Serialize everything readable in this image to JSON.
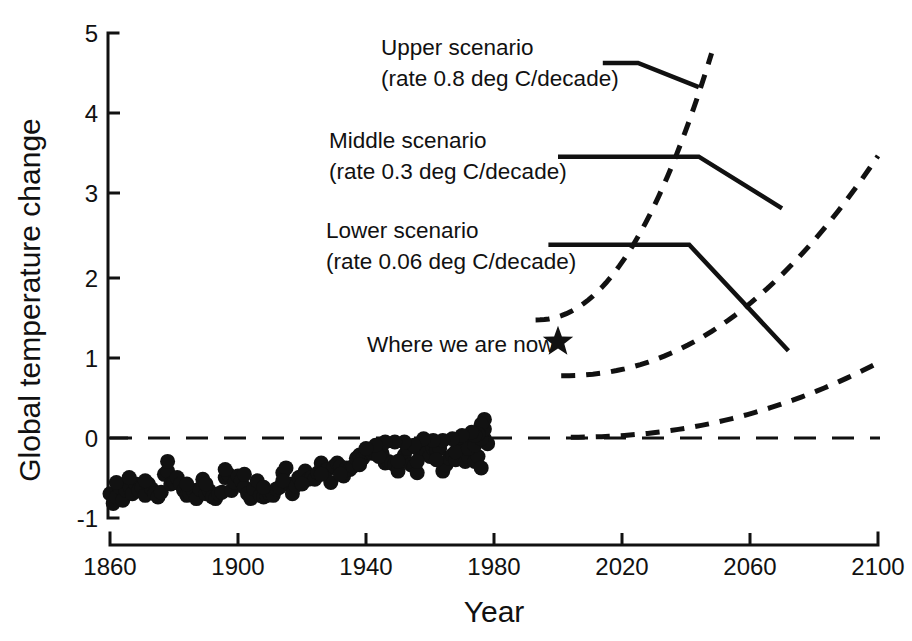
{
  "chart_data": {
    "type": "scatter",
    "title": "",
    "xlabel": "Year",
    "ylabel": "Global temperature change",
    "xlim": [
      1860,
      2100
    ],
    "ylim": [
      -1,
      5
    ],
    "xticks": [
      "1860",
      "1900",
      "1940",
      "1980",
      "2020",
      "2060",
      "2100"
    ],
    "xtick_values": [
      1860,
      1900,
      1940,
      1980,
      2020,
      2060,
      2100
    ],
    "yticks": [
      "-1",
      "0",
      "1",
      "2",
      "3",
      "4",
      "5"
    ],
    "ytick_values": [
      -1,
      0,
      1,
      2,
      3,
      4,
      5
    ],
    "grid": false,
    "legend": "none",
    "zero_reference_line": 0,
    "series": [
      {
        "name": "Observed global temperature change",
        "type": "scatter",
        "marker": "filled-circle",
        "x_range": [
          1860,
          1977
        ],
        "y_range": [
          -0.85,
          0.27
        ],
        "points": [
          [
            1860,
            -0.7
          ],
          [
            1861,
            -0.82
          ],
          [
            1862,
            -0.74
          ],
          [
            1863,
            -0.62
          ],
          [
            1864,
            -0.78
          ],
          [
            1865,
            -0.66
          ],
          [
            1866,
            -0.6
          ],
          [
            1867,
            -0.7
          ],
          [
            1868,
            -0.58
          ],
          [
            1869,
            -0.66
          ],
          [
            1870,
            -0.62
          ],
          [
            1871,
            -0.72
          ],
          [
            1872,
            -0.58
          ],
          [
            1873,
            -0.64
          ],
          [
            1874,
            -0.7
          ],
          [
            1875,
            -0.74
          ],
          [
            1876,
            -0.68
          ],
          [
            1877,
            -0.46
          ],
          [
            1878,
            -0.42
          ],
          [
            1879,
            -0.58
          ],
          [
            1880,
            -0.56
          ],
          [
            1881,
            -0.5
          ],
          [
            1882,
            -0.58
          ],
          [
            1883,
            -0.66
          ],
          [
            1884,
            -0.72
          ],
          [
            1885,
            -0.7
          ],
          [
            1886,
            -0.66
          ],
          [
            1887,
            -0.76
          ],
          [
            1888,
            -0.64
          ],
          [
            1889,
            -0.52
          ],
          [
            1890,
            -0.7
          ],
          [
            1891,
            -0.66
          ],
          [
            1892,
            -0.74
          ],
          [
            1893,
            -0.76
          ],
          [
            1894,
            -0.7
          ],
          [
            1895,
            -0.68
          ],
          [
            1896,
            -0.5
          ],
          [
            1897,
            -0.46
          ],
          [
            1898,
            -0.66
          ],
          [
            1899,
            -0.56
          ],
          [
            1900,
            -0.48
          ],
          [
            1901,
            -0.54
          ],
          [
            1902,
            -0.62
          ],
          [
            1903,
            -0.7
          ],
          [
            1904,
            -0.76
          ],
          [
            1905,
            -0.64
          ],
          [
            1906,
            -0.54
          ],
          [
            1907,
            -0.72
          ],
          [
            1908,
            -0.74
          ],
          [
            1909,
            -0.72
          ],
          [
            1910,
            -0.7
          ],
          [
            1911,
            -0.72
          ],
          [
            1912,
            -0.64
          ],
          [
            1913,
            -0.62
          ],
          [
            1914,
            -0.44
          ],
          [
            1915,
            -0.38
          ],
          [
            1916,
            -0.58
          ],
          [
            1917,
            -0.7
          ],
          [
            1918,
            -0.6
          ],
          [
            1919,
            -0.5
          ],
          [
            1920,
            -0.48
          ],
          [
            1921,
            -0.42
          ],
          [
            1922,
            -0.52
          ],
          [
            1923,
            -0.5
          ],
          [
            1924,
            -0.52
          ],
          [
            1925,
            -0.44
          ],
          [
            1926,
            -0.32
          ],
          [
            1927,
            -0.42
          ],
          [
            1928,
            -0.4
          ],
          [
            1929,
            -0.56
          ],
          [
            1930,
            -0.36
          ],
          [
            1931,
            -0.32
          ],
          [
            1932,
            -0.36
          ],
          [
            1933,
            -0.48
          ],
          [
            1934,
            -0.38
          ],
          [
            1935,
            -0.4
          ],
          [
            1936,
            -0.36
          ],
          [
            1937,
            -0.26
          ],
          [
            1938,
            -0.22
          ],
          [
            1939,
            -0.26
          ],
          [
            1940,
            -0.18
          ],
          [
            1941,
            -0.16
          ],
          [
            1942,
            -0.2
          ],
          [
            1943,
            -0.2
          ],
          [
            1944,
            -0.1
          ],
          [
            1945,
            -0.2
          ],
          [
            1946,
            -0.32
          ],
          [
            1947,
            -0.3
          ],
          [
            1948,
            -0.32
          ],
          [
            1949,
            -0.34
          ],
          [
            1950,
            -0.42
          ],
          [
            1951,
            -0.28
          ],
          [
            1952,
            -0.22
          ],
          [
            1953,
            -0.14
          ],
          [
            1954,
            -0.34
          ],
          [
            1955,
            -0.36
          ],
          [
            1956,
            -0.44
          ],
          [
            1957,
            -0.2
          ],
          [
            1958,
            -0.16
          ],
          [
            1959,
            -0.2
          ],
          [
            1960,
            -0.24
          ],
          [
            1961,
            -0.14
          ],
          [
            1962,
            -0.16
          ],
          [
            1963,
            -0.14
          ],
          [
            1964,
            -0.42
          ],
          [
            1965,
            -0.34
          ],
          [
            1966,
            -0.26
          ],
          [
            1967,
            -0.22
          ],
          [
            1968,
            -0.28
          ],
          [
            1969,
            -0.12
          ],
          [
            1970,
            -0.18
          ],
          [
            1971,
            -0.3
          ],
          [
            1972,
            -0.24
          ],
          [
            1973,
            -0.06
          ],
          [
            1974,
            -0.3
          ],
          [
            1975,
            -0.24
          ],
          [
            1976,
            -0.38
          ],
          [
            1977,
            -0.02
          ],
          [
            1978,
            -0.08
          ],
          [
            1862,
            -0.56
          ],
          [
            1866,
            -0.5
          ],
          [
            1871,
            -0.54
          ],
          [
            1878,
            -0.3
          ],
          [
            1884,
            -0.58
          ],
          [
            1890,
            -0.58
          ],
          [
            1896,
            -0.4
          ],
          [
            1902,
            -0.46
          ],
          [
            1908,
            -0.62
          ],
          [
            1914,
            -0.54
          ],
          [
            1920,
            -0.58
          ],
          [
            1926,
            -0.46
          ],
          [
            1932,
            -0.46
          ],
          [
            1938,
            -0.34
          ],
          [
            1944,
            -0.24
          ],
          [
            1950,
            -0.3
          ],
          [
            1956,
            -0.3
          ],
          [
            1962,
            -0.28
          ],
          [
            1968,
            -0.18
          ],
          [
            1972,
            -0.14
          ],
          [
            1974,
            -0.1
          ],
          [
            1976,
            -0.02
          ],
          [
            1977,
            0.1
          ],
          [
            1977,
            0.22
          ],
          [
            1976,
            0.16
          ],
          [
            1975,
            0.04
          ],
          [
            1974,
            0.02
          ],
          [
            1973,
            0.06
          ],
          [
            1970,
            0.02
          ],
          [
            1967,
            -0.02
          ],
          [
            1964,
            -0.04
          ],
          [
            1961,
            -0.04
          ],
          [
            1958,
            -0.02
          ],
          [
            1955,
            -0.1
          ],
          [
            1952,
            -0.06
          ],
          [
            1949,
            -0.06
          ],
          [
            1946,
            -0.06
          ],
          [
            1943,
            -0.1
          ],
          [
            1940,
            -0.14
          ]
        ]
      },
      {
        "name": "Upper scenario projection",
        "type": "dashed-curve",
        "rate_deg_c_per_decade": 0.8,
        "x_start": 1993,
        "x_end": 2048,
        "y_start": 1.45,
        "y_end": 4.75
      },
      {
        "name": "Middle scenario projection",
        "type": "dashed-curve",
        "rate_deg_c_per_decade": 0.3,
        "x_start": 2001,
        "x_end": 2100,
        "y_start": 0.76,
        "y_end": 3.48
      },
      {
        "name": "Lower scenario projection",
        "type": "dashed-curve",
        "rate_deg_c_per_decade": 0.06,
        "x_start": 2004,
        "x_end": 2100,
        "y_start": 0.0,
        "y_end": 0.92
      }
    ],
    "annotations": [
      {
        "name": "upper-scenario-label",
        "line1": "Upper scenario",
        "line2": "(rate 0.8 deg C/decade)",
        "leader_points": [
          [
            2014,
            4.63
          ],
          [
            2025,
            4.63
          ],
          [
            2044,
            4.33
          ]
        ]
      },
      {
        "name": "middle-scenario-label",
        "line1": "Middle scenario",
        "line2": "(rate 0.3 deg C/decade)",
        "leader_points": [
          [
            2000,
            3.47
          ],
          [
            2044,
            3.47
          ],
          [
            2070,
            2.83
          ]
        ]
      },
      {
        "name": "lower-scenario-label",
        "line1": "Lower scenario",
        "line2": "(rate 0.06 deg C/decade)",
        "leader_points": [
          [
            1997,
            2.38
          ],
          [
            2041,
            2.38
          ],
          [
            2072,
            1.07
          ]
        ]
      },
      {
        "name": "where-we-are-now-label",
        "line1": "Where we are now",
        "marker": "star",
        "marker_point": [
          2000,
          1.18
        ]
      }
    ]
  },
  "axes": {
    "y_title": "Global temperature change",
    "x_title": "Year",
    "y_tick_labels": [
      "5",
      "4",
      "3",
      "2",
      "1",
      "0",
      "-1"
    ],
    "x_tick_labels": [
      "1860",
      "1900",
      "1940",
      "1980",
      "2020",
      "2060",
      "2100"
    ]
  },
  "labels": {
    "upper_line1": "Upper scenario",
    "upper_line2": "(rate 0.8 deg C/decade)",
    "middle_line1": "Middle scenario",
    "middle_line2": "(rate 0.3 deg C/decade)",
    "lower_line1": "Lower scenario",
    "lower_line2": "(rate 0.06 deg C/decade)",
    "now_label": "Where we are now"
  },
  "colors": {
    "ink": "#111111",
    "background": "#ffffff"
  }
}
